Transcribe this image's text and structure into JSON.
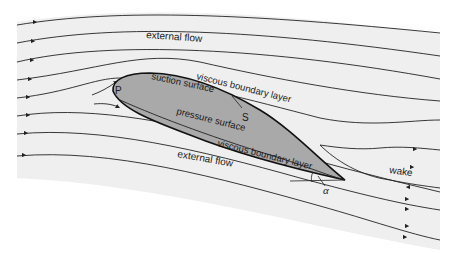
{
  "diagram": {
    "colors": {
      "background_panel": "#efefef",
      "airfoil_fill": "#a9a9a9",
      "line": "#222222"
    },
    "labels": {
      "external_flow_top": "external flow",
      "external_flow_bottom": "external flow",
      "suction_surface": "suction surface",
      "pressure_surface": "pressure surface",
      "viscous_bl_top": "viscous boundary layer",
      "viscous_bl_bottom": "viscous boundary layer",
      "stagnation_point": "P",
      "separation_point": "S",
      "wake": "wake",
      "angle": "α"
    }
  }
}
